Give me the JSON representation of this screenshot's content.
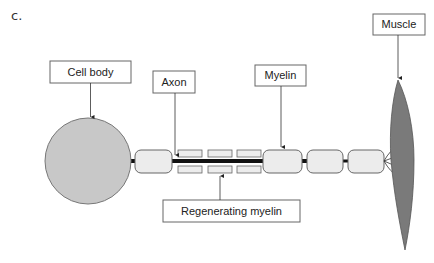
{
  "figure": {
    "panel_label": "c.",
    "labels": {
      "cell_body": "Cell body",
      "axon": "Axon",
      "myelin": "Myelin",
      "muscle": "Muscle",
      "regenerating_myelin": "Regenerating myelin"
    },
    "colors": {
      "cell_body_fill": "#c8c8c8",
      "myelin_fill": "#ececec",
      "muscle_fill": "#7a7a7a",
      "axon_line": "#111111",
      "box_stroke": "#666666"
    }
  }
}
